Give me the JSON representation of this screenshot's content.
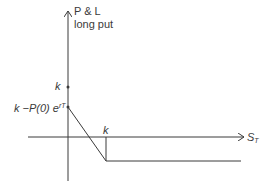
{
  "diagram": {
    "y_axis": {
      "label_line1": "P & L",
      "label_line2": "long put"
    },
    "x_axis": {
      "label_main": "S",
      "label_sub": "T"
    },
    "y_marks": [
      {
        "label": "k",
        "y_px": 87
      },
      {
        "label_main": "k −P(0) e",
        "label_sup": "rT",
        "y_px": 107
      }
    ],
    "x_marks": [
      {
        "label": "k",
        "x_px": 106
      }
    ],
    "payoff_path": "line from intercept (0, k−P(0)e^{rT}) descending to (k, −P(0)e^{rT}) then flat",
    "colors": {
      "line": "#3a3a3a",
      "background": "#ffffff"
    }
  }
}
